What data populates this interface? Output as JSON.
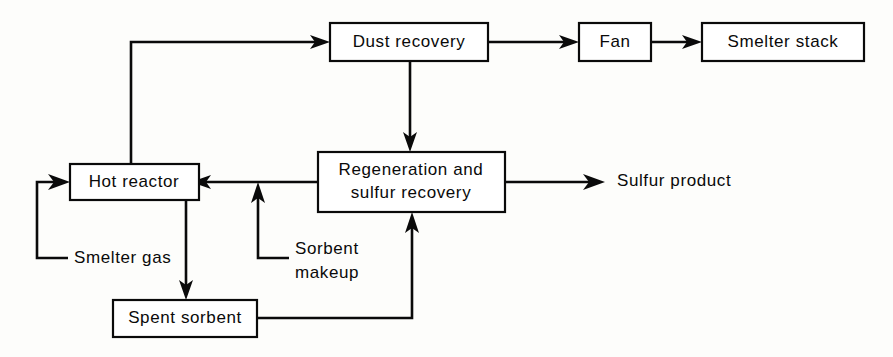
{
  "diagram": {
    "background_color": "#fdfdfb",
    "line_color": "#0a0a0a",
    "box_fill": "#ffffff",
    "nodes": {
      "dust_recovery": {
        "label": "Dust  recovery"
      },
      "fan": {
        "label": "Fan"
      },
      "smelter_stack": {
        "label": "Smelter  stack"
      },
      "hot_reactor": {
        "label": "Hot  reactor"
      },
      "regeneration_line1": {
        "label": "Regeneration  and"
      },
      "regeneration_line2": {
        "label": "sulfur  recovery"
      },
      "spent_sorbent": {
        "label": "Spent  sorbent"
      }
    },
    "stream_labels": {
      "sulfur_product": "Sulfur product",
      "smelter_gas": "Smelter gas",
      "sorbent_makeup_line1": "Sorbent",
      "sorbent_makeup_line2": "makeup"
    }
  }
}
